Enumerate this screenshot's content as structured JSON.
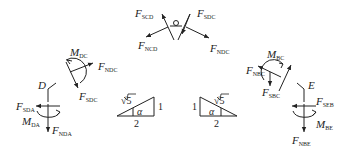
{
  "diagram": {
    "type": "free-body diagrams",
    "hinge_top": {
      "labels": [
        {
          "main": "F",
          "sub": "SCD"
        },
        {
          "main": "F",
          "sub": "SDC"
        },
        {
          "main": "F",
          "sub": "NCD"
        },
        {
          "main": "F",
          "sub": "NDC"
        }
      ]
    },
    "left_member_DC": {
      "labels": [
        {
          "main": "M",
          "sub": "DC"
        },
        {
          "main": "F",
          "sub": "NDC"
        },
        {
          "main": "F",
          "sub": "SDC"
        }
      ]
    },
    "joint_D": {
      "node": "D",
      "labels": [
        {
          "main": "F",
          "sub": "SDA"
        },
        {
          "main": "M",
          "sub": "DA"
        },
        {
          "main": "F",
          "sub": "NDA"
        }
      ]
    },
    "right_member_BC": {
      "labels": [
        {
          "main": "M",
          "sub": "BC"
        },
        {
          "main": "F",
          "sub": "NBC"
        },
        {
          "main": "F",
          "sub": "SBC"
        }
      ]
    },
    "joint_E": {
      "node": "E",
      "labels": [
        {
          "main": "F",
          "sub": "SEB"
        },
        {
          "main": "M",
          "sub": "BE"
        },
        {
          "main": "F",
          "sub": "NBE"
        }
      ]
    },
    "triangles": [
      {
        "hyp": "√5",
        "vertical": "1",
        "base": "2",
        "angle": "α"
      },
      {
        "hyp": "√5",
        "vertical": "1",
        "base": "2",
        "angle": "α"
      }
    ]
  }
}
